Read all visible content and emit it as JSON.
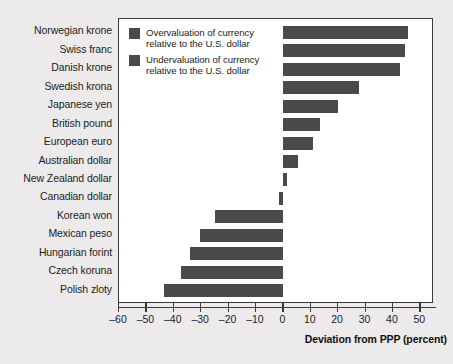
{
  "chart_data": {
    "type": "bar",
    "orientation": "horizontal",
    "title": "",
    "xlabel": "Deviation from PPP (percent)",
    "ylabel": "",
    "xlim": [
      -60,
      55
    ],
    "grid": false,
    "legend_position": "top-left-inside",
    "categories": [
      "Norwegian krone",
      "Swiss franc",
      "Danish krone",
      "Swedish krona",
      "Japanese yen",
      "British pound",
      "European euro",
      "Australian dollar",
      "New Zealand dollar",
      "Canadian dollar",
      "Korean won",
      "Mexican peso",
      "Hungarian forint",
      "Czech koruna",
      "Polish zloty"
    ],
    "values": [
      45.5,
      44.5,
      42.5,
      27.5,
      20.0,
      13.5,
      11.0,
      5.5,
      1.5,
      -1.5,
      -25.0,
      -30.5,
      -34.0,
      -37.5,
      -43.5
    ],
    "xticks": [
      -60,
      -50,
      -40,
      -30,
      -20,
      -10,
      0,
      10,
      20,
      30,
      40,
      50
    ],
    "xticklabels": [
      "–60",
      "–50",
      "–40",
      "–30",
      "–20",
      "–10",
      "0",
      "10",
      "20",
      "30",
      "40",
      "50"
    ],
    "series": [
      {
        "name": "Overvaluation of currency relative to the U.S. dollar",
        "color": "#4a4a4a"
      },
      {
        "name": "Undervaluation of currency relative to the U.S. dollar",
        "color": "#4a4a4a"
      }
    ],
    "legend": [
      {
        "line1": "Overvaluation of currency",
        "line2": "relative to the U.S. dollar",
        "color": "#4a4a4a"
      },
      {
        "line1": "Undervaluation of currency",
        "line2": "relative to the U.S. dollar",
        "color": "#4a4a4a"
      }
    ],
    "colors": {
      "bar": "#4a4a4a",
      "axis": "#3a3a3a",
      "plot_background": "#ffffff",
      "page_background": "#eceaea",
      "text": "#1d1d1d"
    }
  }
}
